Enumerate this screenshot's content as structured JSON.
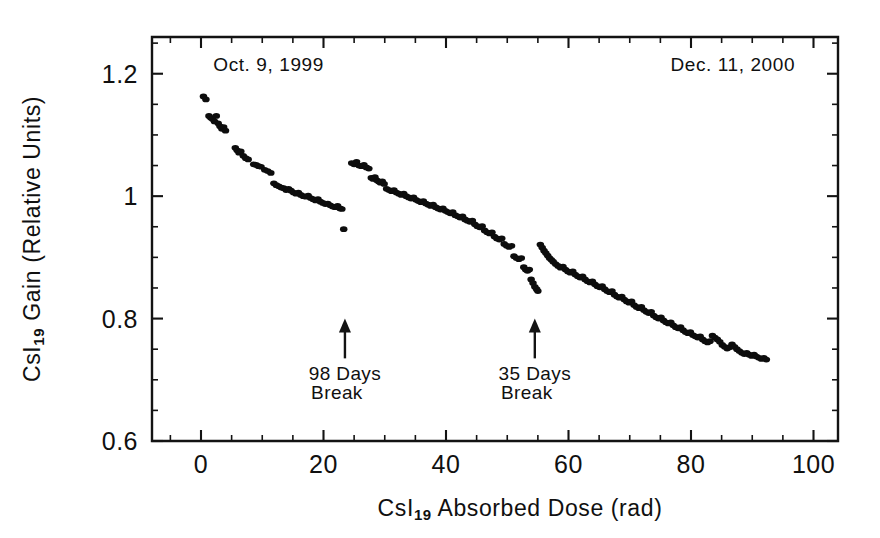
{
  "chart_data": {
    "type": "scatter",
    "title": "",
    "xlabel": "CsI19 Absorbed Dose (rad)",
    "xlabel_main_pre": "CsI",
    "xlabel_sub": "19",
    "xlabel_main_post": " Absorbed Dose (rad)",
    "ylabel": "CsI19 Gain (Relative Units)",
    "ylabel_main_pre": "CsI",
    "ylabel_sub": "19",
    "ylabel_main_post": " Gain (Relative Units)",
    "xlim": [
      -8,
      104
    ],
    "ylim": [
      0.6,
      1.26
    ],
    "xticks": [
      0,
      20,
      40,
      60,
      80,
      100
    ],
    "xticklabels": [
      "0",
      "20",
      "40",
      "60",
      "80",
      "100"
    ],
    "xtick_minor_step": 5,
    "yticks": [
      0.6,
      0.8,
      1.0,
      1.2
    ],
    "yticklabels": [
      "0.6",
      "0.8",
      "1",
      "1.2"
    ],
    "ytick_minor_step": 0.05,
    "grid": false,
    "legend": "none",
    "marker_color": "#0d0d0d",
    "marker_size": 3.0,
    "annotations": [
      {
        "id": "start-date",
        "text": "Oct. 9, 1999",
        "x": 2,
        "y": 1.205,
        "align": "left"
      },
      {
        "id": "end-date",
        "text": "Dec. 11, 2000",
        "x": 97,
        "y": 1.205,
        "align": "right"
      },
      {
        "id": "break-1",
        "line1": "98 Days",
        "line2": "Break",
        "arrow_x": 23.5,
        "arrow_y_tail": 0.735,
        "arrow_y_head": 0.8,
        "label_x": 23.5,
        "label_y1": 0.7,
        "label_y2": 0.668
      },
      {
        "id": "break-2",
        "line1": "35 Days",
        "line2": "Break",
        "arrow_x": 54.5,
        "arrow_y_tail": 0.735,
        "arrow_y_head": 0.8,
        "label_x": 54.5,
        "label_y1": 0.7,
        "label_y2": 0.668
      }
    ],
    "series": [
      {
        "name": "CsI19 gain",
        "segment": "pre-break-1",
        "points": [
          [
            0.4,
            1.163
          ],
          [
            0.8,
            1.158
          ],
          [
            1.3,
            1.131
          ],
          [
            1.6,
            1.128
          ],
          [
            1.9,
            1.126
          ],
          [
            2.2,
            1.122
          ],
          [
            2.5,
            1.131
          ],
          [
            2.8,
            1.119
          ],
          [
            3.1,
            1.114
          ],
          [
            3.4,
            1.11
          ],
          [
            3.7,
            1.113
          ],
          [
            4.0,
            1.107
          ],
          [
            5.6,
            1.079
          ],
          [
            5.9,
            1.075
          ],
          [
            6.2,
            1.071
          ],
          [
            6.5,
            1.073
          ],
          [
            6.9,
            1.066
          ],
          [
            7.3,
            1.062
          ],
          [
            7.7,
            1.06
          ],
          [
            8.6,
            1.052
          ],
          [
            9.0,
            1.051
          ],
          [
            9.4,
            1.049
          ],
          [
            9.8,
            1.048
          ],
          [
            10.4,
            1.043
          ],
          [
            10.9,
            1.041
          ],
          [
            11.4,
            1.038
          ],
          [
            11.9,
            1.021
          ],
          [
            12.3,
            1.018
          ],
          [
            12.7,
            1.016
          ],
          [
            13.1,
            1.014
          ],
          [
            13.5,
            1.013
          ],
          [
            13.9,
            1.01
          ],
          [
            14.3,
            1.012
          ],
          [
            14.7,
            1.009
          ],
          [
            15.1,
            1.006
          ],
          [
            15.5,
            1.004
          ],
          [
            15.9,
            1.006
          ],
          [
            16.3,
            1.002
          ],
          [
            16.7,
            1.0
          ],
          [
            17.1,
            0.999
          ],
          [
            17.5,
            1.001
          ],
          [
            17.9,
            0.997
          ],
          [
            18.3,
            0.995
          ],
          [
            18.7,
            0.993
          ],
          [
            19.1,
            0.995
          ],
          [
            19.5,
            0.991
          ],
          [
            19.9,
            0.989
          ],
          [
            20.3,
            0.987
          ],
          [
            20.7,
            0.988
          ],
          [
            21.1,
            0.985
          ],
          [
            21.5,
            0.983
          ],
          [
            21.9,
            0.982
          ],
          [
            22.3,
            0.984
          ],
          [
            22.7,
            0.98
          ],
          [
            23.0,
            0.979
          ],
          [
            23.3,
            0.946
          ]
        ]
      },
      {
        "name": "CsI19 gain",
        "segment": "post-break-1",
        "points": [
          [
            24.6,
            1.054
          ],
          [
            25.0,
            1.052
          ],
          [
            25.4,
            1.056
          ],
          [
            25.8,
            1.05
          ],
          [
            26.2,
            1.049
          ],
          [
            26.6,
            1.051
          ],
          [
            27.0,
            1.047
          ],
          [
            27.4,
            1.045
          ],
          [
            27.8,
            1.03
          ],
          [
            28.1,
            1.028
          ],
          [
            28.4,
            1.031
          ],
          [
            28.7,
            1.026
          ],
          [
            29.0,
            1.024
          ],
          [
            29.3,
            1.022
          ],
          [
            29.6,
            1.024
          ],
          [
            29.9,
            1.02
          ],
          [
            30.3,
            1.012
          ],
          [
            30.7,
            1.01
          ],
          [
            31.1,
            1.008
          ],
          [
            31.5,
            1.01
          ],
          [
            31.9,
            1.006
          ],
          [
            32.3,
            1.004
          ],
          [
            32.7,
            1.002
          ],
          [
            33.1,
            1.004
          ],
          [
            33.5,
            1.0
          ],
          [
            33.9,
            0.998
          ],
          [
            34.3,
            0.996
          ],
          [
            34.7,
            0.998
          ],
          [
            35.1,
            0.994
          ],
          [
            35.5,
            0.992
          ],
          [
            35.9,
            0.99
          ],
          [
            36.3,
            0.992
          ],
          [
            36.7,
            0.988
          ],
          [
            37.1,
            0.986
          ],
          [
            37.5,
            0.984
          ],
          [
            37.9,
            0.986
          ],
          [
            38.3,
            0.982
          ],
          [
            38.7,
            0.98
          ],
          [
            39.1,
            0.978
          ],
          [
            39.5,
            0.98
          ],
          [
            39.9,
            0.976
          ],
          [
            40.3,
            0.974
          ],
          [
            40.7,
            0.972
          ],
          [
            41.1,
            0.974
          ],
          [
            41.5,
            0.969
          ],
          [
            41.9,
            0.967
          ],
          [
            42.3,
            0.965
          ],
          [
            42.7,
            0.967
          ],
          [
            43.1,
            0.962
          ],
          [
            43.5,
            0.96
          ],
          [
            43.9,
            0.958
          ],
          [
            44.3,
            0.96
          ],
          [
            44.7,
            0.954
          ],
          [
            45.1,
            0.951
          ],
          [
            45.5,
            0.949
          ],
          [
            45.9,
            0.951
          ],
          [
            46.3,
            0.944
          ],
          [
            46.7,
            0.941
          ],
          [
            47.1,
            0.939
          ],
          [
            47.5,
            0.941
          ],
          [
            47.9,
            0.934
          ],
          [
            48.3,
            0.931
          ],
          [
            48.7,
            0.929
          ],
          [
            49.1,
            0.931
          ],
          [
            49.5,
            0.922
          ],
          [
            49.9,
            0.919
          ],
          [
            50.3,
            0.917
          ],
          [
            50.7,
            0.919
          ],
          [
            51.1,
            0.902
          ],
          [
            51.5,
            0.899
          ],
          [
            51.9,
            0.897
          ],
          [
            52.3,
            0.899
          ],
          [
            52.7,
            0.884
          ],
          [
            53.0,
            0.88
          ],
          [
            53.3,
            0.878
          ],
          [
            53.6,
            0.88
          ],
          [
            53.9,
            0.864
          ],
          [
            54.2,
            0.858
          ],
          [
            54.5,
            0.852
          ],
          [
            54.8,
            0.848
          ],
          [
            55.0,
            0.845
          ]
        ]
      },
      {
        "name": "CsI19 gain",
        "segment": "post-break-2",
        "points": [
          [
            55.4,
            0.921
          ],
          [
            55.7,
            0.916
          ],
          [
            56.0,
            0.911
          ],
          [
            56.3,
            0.907
          ],
          [
            56.6,
            0.903
          ],
          [
            56.9,
            0.899
          ],
          [
            57.2,
            0.896
          ],
          [
            57.5,
            0.893
          ],
          [
            57.9,
            0.889
          ],
          [
            58.3,
            0.886
          ],
          [
            58.7,
            0.883
          ],
          [
            59.1,
            0.885
          ],
          [
            59.5,
            0.88
          ],
          [
            59.9,
            0.877
          ],
          [
            60.3,
            0.875
          ],
          [
            60.7,
            0.877
          ],
          [
            61.1,
            0.872
          ],
          [
            61.5,
            0.869
          ],
          [
            61.9,
            0.867
          ],
          [
            62.3,
            0.869
          ],
          [
            62.7,
            0.864
          ],
          [
            63.1,
            0.861
          ],
          [
            63.5,
            0.859
          ],
          [
            63.9,
            0.861
          ],
          [
            64.3,
            0.856
          ],
          [
            64.7,
            0.853
          ],
          [
            65.1,
            0.851
          ],
          [
            65.5,
            0.853
          ],
          [
            65.9,
            0.848
          ],
          [
            66.3,
            0.845
          ],
          [
            66.7,
            0.843
          ],
          [
            67.1,
            0.845
          ],
          [
            67.5,
            0.839
          ],
          [
            67.9,
            0.836
          ],
          [
            68.3,
            0.834
          ],
          [
            68.7,
            0.836
          ],
          [
            69.1,
            0.831
          ],
          [
            69.5,
            0.828
          ],
          [
            69.9,
            0.826
          ],
          [
            70.3,
            0.828
          ],
          [
            70.7,
            0.822
          ],
          [
            71.1,
            0.819
          ],
          [
            71.5,
            0.817
          ],
          [
            71.9,
            0.819
          ],
          [
            72.3,
            0.814
          ],
          [
            72.7,
            0.811
          ],
          [
            73.1,
            0.809
          ],
          [
            73.5,
            0.811
          ],
          [
            73.9,
            0.805
          ],
          [
            74.3,
            0.802
          ],
          [
            74.7,
            0.8
          ],
          [
            75.1,
            0.802
          ],
          [
            75.5,
            0.797
          ],
          [
            75.9,
            0.794
          ],
          [
            76.3,
            0.792
          ],
          [
            76.7,
            0.794
          ],
          [
            77.1,
            0.789
          ],
          [
            77.5,
            0.786
          ],
          [
            77.9,
            0.784
          ],
          [
            78.3,
            0.786
          ],
          [
            78.7,
            0.781
          ],
          [
            79.1,
            0.778
          ],
          [
            79.5,
            0.776
          ],
          [
            79.9,
            0.778
          ],
          [
            80.3,
            0.773
          ],
          [
            80.7,
            0.771
          ],
          [
            81.1,
            0.769
          ],
          [
            81.5,
            0.771
          ],
          [
            81.9,
            0.766
          ],
          [
            82.3,
            0.763
          ],
          [
            82.7,
            0.761
          ],
          [
            83.1,
            0.763
          ],
          [
            83.5,
            0.772
          ],
          [
            83.9,
            0.769
          ],
          [
            84.3,
            0.766
          ],
          [
            84.7,
            0.762
          ],
          [
            85.1,
            0.757
          ],
          [
            85.5,
            0.754
          ],
          [
            85.9,
            0.751
          ],
          [
            86.3,
            0.753
          ],
          [
            86.7,
            0.758
          ],
          [
            87.1,
            0.754
          ],
          [
            87.5,
            0.75
          ],
          [
            87.9,
            0.747
          ],
          [
            88.3,
            0.744
          ],
          [
            88.7,
            0.742
          ],
          [
            89.1,
            0.744
          ],
          [
            89.5,
            0.741
          ],
          [
            89.9,
            0.739
          ],
          [
            90.3,
            0.741
          ],
          [
            90.7,
            0.738
          ],
          [
            91.1,
            0.736
          ],
          [
            91.5,
            0.734
          ],
          [
            91.9,
            0.736
          ],
          [
            92.3,
            0.733
          ]
        ]
      }
    ]
  }
}
